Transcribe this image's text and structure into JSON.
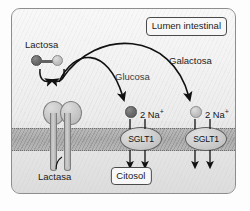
{
  "diagram": {
    "compartments": {
      "apical_label": "Lumen intestinal",
      "basal_label": "Citosol"
    },
    "molecules": {
      "disaccharide_label": "Lactosa",
      "monosaccharide_1_label": "Glucosa",
      "monosaccharide_2_label": "Galactosa"
    },
    "enzyme": {
      "label": "Lactasa"
    },
    "transporters": [
      {
        "label": "SGLT1",
        "cotransported_ion_label": "2 Na",
        "ion_charge": "+"
      },
      {
        "label": "SGLT1",
        "cotransported_ion_label": "2 Na",
        "ion_charge": "+"
      }
    ],
    "colors": {
      "glucose_sphere": "#6e6e6e",
      "galactose_sphere": "#c3c3c3",
      "membrane": "#a0a0a0",
      "outline": "#4a4a4a",
      "background": "#ececec"
    }
  }
}
